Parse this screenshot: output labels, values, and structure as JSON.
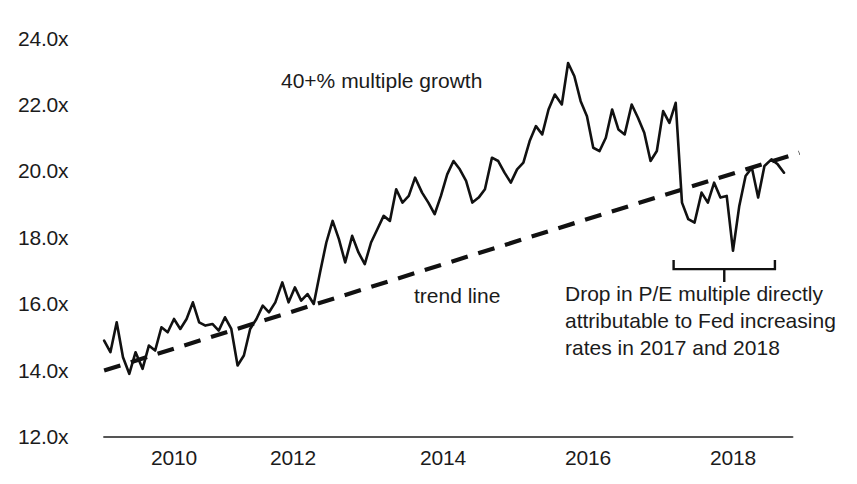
{
  "chart_data": {
    "type": "line",
    "title": "",
    "xlabel": "",
    "ylabel": "",
    "xlim": [
      2009.0,
      2019.0
    ],
    "ylim": [
      12.0,
      24.0
    ],
    "grid": false,
    "legend": "none",
    "y_tick_labels": [
      "24.0x",
      "22.0x",
      "20.0x",
      "18.0x",
      "16.0x",
      "14.0x",
      "12.0x"
    ],
    "y_tick_values": [
      24.0,
      22.0,
      20.0,
      18.0,
      16.0,
      14.0,
      12.0
    ],
    "x_tick_labels": [
      "2010",
      "2012",
      "2014",
      "2016",
      "2018"
    ],
    "x_tick_values": [
      2010,
      2012,
      2014,
      2016,
      2018
    ],
    "series": [
      {
        "name": "P/E multiple",
        "style": "solid",
        "color": "#111111",
        "x": [
          2009.0,
          2009.09,
          2009.18,
          2009.27,
          2009.36,
          2009.45,
          2009.55,
          2009.64,
          2009.73,
          2009.82,
          2009.91,
          2010.0,
          2010.09,
          2010.18,
          2010.27,
          2010.36,
          2010.45,
          2010.55,
          2010.64,
          2010.73,
          2010.82,
          2010.91,
          2011.0,
          2011.09,
          2011.18,
          2011.27,
          2011.36,
          2011.45,
          2011.55,
          2011.64,
          2011.73,
          2011.82,
          2011.91,
          2012.0,
          2012.09,
          2012.18,
          2012.27,
          2012.36,
          2012.45,
          2012.55,
          2012.64,
          2012.73,
          2012.82,
          2012.91,
          2013.0,
          2013.09,
          2013.18,
          2013.27,
          2013.36,
          2013.45,
          2013.55,
          2013.64,
          2013.73,
          2013.82,
          2013.91,
          2014.0,
          2014.09,
          2014.18,
          2014.27,
          2014.36,
          2014.45,
          2014.55,
          2014.64,
          2014.73,
          2014.82,
          2014.91,
          2015.0,
          2015.09,
          2015.18,
          2015.27,
          2015.36,
          2015.45,
          2015.55,
          2015.64,
          2015.73,
          2015.82,
          2015.91,
          2016.0,
          2016.09,
          2016.18,
          2016.27,
          2016.36,
          2016.45,
          2016.55,
          2016.64,
          2016.73,
          2016.82,
          2016.91,
          2017.0,
          2017.09,
          2017.18,
          2017.27,
          2017.36,
          2017.45,
          2017.55,
          2017.64,
          2017.73,
          2017.82,
          2017.91,
          2018.0,
          2018.09,
          2018.18,
          2018.27,
          2018.36,
          2018.45,
          2018.55,
          2018.64,
          2018.73
        ],
        "y": [
          14.9,
          14.55,
          15.45,
          14.4,
          13.9,
          14.55,
          14.05,
          14.75,
          14.6,
          15.3,
          15.15,
          15.55,
          15.25,
          15.55,
          16.05,
          15.45,
          15.35,
          15.4,
          15.2,
          15.6,
          15.25,
          14.15,
          14.45,
          15.25,
          15.55,
          15.95,
          15.75,
          16.05,
          16.65,
          16.05,
          16.5,
          16.1,
          16.3,
          16.0,
          16.95,
          17.85,
          18.5,
          17.95,
          17.25,
          18.05,
          17.55,
          17.2,
          17.85,
          18.25,
          18.65,
          18.5,
          19.45,
          19.05,
          19.25,
          19.8,
          19.35,
          19.05,
          18.7,
          19.25,
          19.9,
          20.3,
          20.05,
          19.7,
          19.05,
          19.2,
          19.45,
          20.4,
          20.3,
          19.95,
          19.65,
          20.05,
          20.25,
          20.9,
          21.35,
          21.1,
          21.85,
          22.3,
          22.0,
          23.25,
          22.85,
          22.1,
          21.65,
          20.7,
          20.6,
          21.0,
          21.85,
          21.25,
          21.1,
          22.0,
          21.6,
          21.15,
          20.3,
          20.6,
          21.8,
          21.45,
          22.05,
          19.05,
          18.55,
          18.45,
          19.35,
          19.05,
          19.65,
          19.2,
          19.25,
          17.6,
          18.95,
          19.85,
          20.1,
          19.2,
          20.15,
          20.35,
          20.2,
          19.95
        ]
      },
      {
        "name": "trend line",
        "style": "dashed",
        "color": "#111111",
        "x": [
          2009.0,
          2018.95
        ],
        "y": [
          14.0,
          20.55
        ]
      }
    ],
    "annotations": [
      {
        "name": "growth-label",
        "text": "40+% multiple growth",
        "x": 2012.0,
        "y": 22.5
      },
      {
        "name": "trend-label",
        "text": "trend line",
        "x": 2013.9,
        "y": 16.3
      },
      {
        "name": "drop-label-line1",
        "text": "Drop in P/E multiple directly",
        "x": 2016.6,
        "y": 16.4
      },
      {
        "name": "drop-label-line2",
        "text": "attributable to Fed increasing",
        "x": 2016.6,
        "y": 15.6
      },
      {
        "name": "drop-label-line3",
        "text": "rates in 2017 and 2018",
        "x": 2016.6,
        "y": 14.8
      }
    ],
    "bracket": {
      "name": "drop-bracket",
      "x_start": 2017.15,
      "x_end": 2018.6,
      "y": 17.05,
      "label": "Drop in P/E multiple directly attributable to Fed increasing rates in 2017 and 2018"
    }
  },
  "axes": {
    "y_labels": [
      "24.0x",
      "22.0x",
      "20.0x",
      "18.0x",
      "16.0x",
      "14.0x",
      "12.0x"
    ],
    "x_labels": [
      "2010",
      "2012",
      "2014",
      "2016",
      "2018"
    ]
  },
  "annotations": {
    "growth": "40+% multiple growth",
    "trend": "trend line",
    "drop_line1": "Drop in P/E multiple directly",
    "drop_line2": "attributable to Fed increasing",
    "drop_line3": "rates in 2017 and 2018"
  },
  "colors": {
    "line": "#111111",
    "text": "#1b1b1b",
    "axis": "#4a4a4a"
  }
}
